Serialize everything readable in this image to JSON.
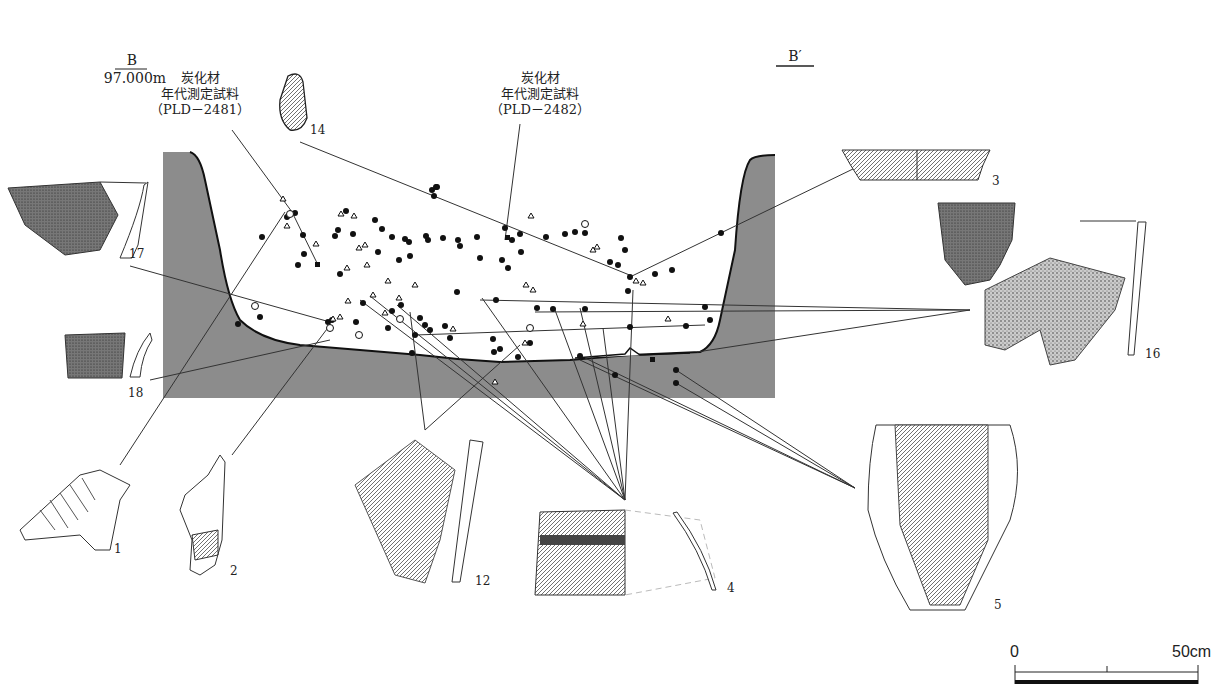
{
  "section": {
    "left_label": "B",
    "left_elevation": "97.000m",
    "right_label": "B′"
  },
  "samples": [
    {
      "line1": "炭化材",
      "line2": "年代測定試料",
      "line3": "（PLD－2481）"
    },
    {
      "line1": "炭化材",
      "line2": "年代測定試料",
      "line3": "（PLD－2482）"
    }
  ],
  "artifacts": [
    {
      "id": "1",
      "label": "1"
    },
    {
      "id": "2",
      "label": "2"
    },
    {
      "id": "3",
      "label": "3"
    },
    {
      "id": "4",
      "label": "4"
    },
    {
      "id": "5",
      "label": "5"
    },
    {
      "id": "12",
      "label": "12"
    },
    {
      "id": "14",
      "label": "14"
    },
    {
      "id": "16",
      "label": "16"
    },
    {
      "id": "17",
      "label": "17"
    },
    {
      "id": "18",
      "label": "18"
    }
  ],
  "scale": {
    "start": "0",
    "end": "50cm"
  },
  "legend_symbols": [
    "filled-circle",
    "open-circle",
    "open-triangle",
    "filled-square"
  ],
  "colors": {
    "fill": "#8c8c8c",
    "line": "#222222",
    "background": "#ffffff"
  }
}
